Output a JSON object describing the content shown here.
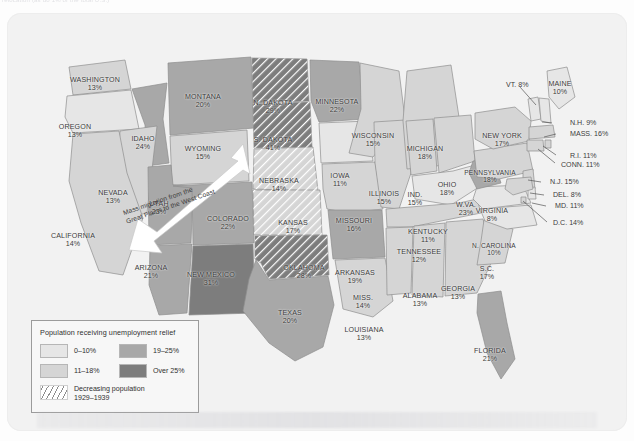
{
  "caption": {
    "top_line": "relocation (as do 1% of the total U.S.)"
  },
  "map": {
    "title": "Population receiving unemployment relief map of the United States",
    "annotation": {
      "migration_line1": "Mass migration from the",
      "migration_line2": "Great Plains to the West Coast"
    },
    "colors": {
      "class_0_10": "#e6e6e6",
      "class_11_18": "#d5d5d5",
      "class_19_25": "#a8a8a8",
      "class_over_25": "#7d7d7d",
      "decreasing_hatch": "#8d8d8d",
      "background": "#f2f2f2",
      "border": "#9b9b9b",
      "label_text": "#3a3a3a"
    },
    "states": [
      {
        "id": "washington",
        "name": "WASHINGTON",
        "pct": "13%",
        "x": 88,
        "y": 72,
        "cls": "class_11_18",
        "hatched": false
      },
      {
        "id": "oregon",
        "name": "OREGON",
        "pct": "13%",
        "x": 68,
        "y": 119,
        "cls": "class_0_10",
        "hatched": false
      },
      {
        "id": "idaho",
        "name": "IDAHO",
        "pct": "24%",
        "x": 136,
        "y": 131,
        "cls": "class_19_25",
        "hatched": false
      },
      {
        "id": "montana",
        "name": "MONTANA",
        "pct": "20%",
        "x": 196,
        "y": 89,
        "cls": "class_19_25",
        "hatched": false
      },
      {
        "id": "wyoming",
        "name": "WYOMING",
        "pct": "15%",
        "x": 196,
        "y": 141,
        "cls": "class_11_18",
        "hatched": false
      },
      {
        "id": "nevada",
        "name": "NEVADA",
        "pct": "13%",
        "x": 106,
        "y": 185,
        "cls": "class_11_18",
        "hatched": false
      },
      {
        "id": "california",
        "name": "CALIFORNIA",
        "pct": "14%",
        "x": 66,
        "y": 228,
        "cls": "class_11_18",
        "hatched": false
      },
      {
        "id": "utah",
        "name": "UTAH",
        "pct": "23%",
        "x": 152,
        "y": 196,
        "cls": "class_19_25",
        "hatched": false
      },
      {
        "id": "arizona",
        "name": "ARIZONA",
        "pct": "21%",
        "x": 144,
        "y": 260,
        "cls": "class_19_25",
        "hatched": false
      },
      {
        "id": "new-mexico",
        "name": "NEW MEXICO",
        "pct": "31%",
        "x": 204,
        "y": 267,
        "cls": "class_over_25",
        "hatched": false
      },
      {
        "id": "colorado",
        "name": "COLORADO",
        "pct": "22%",
        "x": 221,
        "y": 211,
        "cls": "class_19_25",
        "hatched": false
      },
      {
        "id": "north-dakota",
        "name": "N. DAKOTA",
        "pct": "29%",
        "x": 266,
        "y": 95,
        "cls": "class_over_25",
        "hatched": true
      },
      {
        "id": "south-dakota",
        "name": "S. DAKOTA",
        "pct": "41%",
        "x": 266,
        "y": 132,
        "cls": "class_over_25",
        "hatched": true
      },
      {
        "id": "nebraska",
        "name": "NEBRASKA",
        "pct": "14%",
        "x": 272,
        "y": 173,
        "cls": "class_11_18",
        "hatched": true
      },
      {
        "id": "kansas",
        "name": "KANSAS",
        "pct": "17%",
        "x": 286,
        "y": 215,
        "cls": "class_11_18",
        "hatched": true
      },
      {
        "id": "oklahoma",
        "name": "OKLAHOMA",
        "pct": "28%",
        "x": 297,
        "y": 260,
        "cls": "class_over_25",
        "hatched": true
      },
      {
        "id": "texas",
        "name": "TEXAS",
        "pct": "20%",
        "x": 283,
        "y": 305,
        "cls": "class_19_25",
        "hatched": false
      },
      {
        "id": "minnesota",
        "name": "MINNESOTA",
        "pct": "22%",
        "x": 330,
        "y": 94,
        "cls": "class_19_25",
        "hatched": false
      },
      {
        "id": "iowa",
        "name": "IOWA",
        "pct": "11%",
        "x": 333,
        "y": 168,
        "cls": "class_0_10",
        "hatched": false
      },
      {
        "id": "missouri",
        "name": "MISSOURI",
        "pct": "16%",
        "x": 347,
        "y": 213,
        "cls": "class_11_18",
        "hatched": false
      },
      {
        "id": "arkansas",
        "name": "ARKANSAS",
        "pct": "19%",
        "x": 348,
        "y": 265,
        "cls": "class_19_25",
        "hatched": false
      },
      {
        "id": "louisiana",
        "name": "LOUISIANA",
        "pct": "13%",
        "x": 357,
        "y": 322,
        "cls": "class_11_18",
        "hatched": false
      },
      {
        "id": "wisconsin",
        "name": "WISCONSIN",
        "pct": "15%",
        "x": 366,
        "y": 128,
        "cls": "class_11_18",
        "hatched": false
      },
      {
        "id": "illinois",
        "name": "ILLINOIS",
        "pct": "15%",
        "x": 377,
        "y": 186,
        "cls": "class_11_18",
        "hatched": false
      },
      {
        "id": "michigan",
        "name": "MICHIGAN",
        "pct": "18%",
        "x": 418,
        "y": 141,
        "cls": "class_11_18",
        "hatched": false
      },
      {
        "id": "indiana",
        "name": "IND.",
        "pct": "15%",
        "x": 408,
        "y": 187,
        "cls": "class_11_18",
        "hatched": false
      },
      {
        "id": "ohio",
        "name": "OHIO",
        "pct": "18%",
        "x": 440,
        "y": 177,
        "cls": "class_11_18",
        "hatched": false
      },
      {
        "id": "kentucky",
        "name": "KENTUCKY",
        "pct": "11%",
        "x": 421,
        "y": 224,
        "cls": "class_0_10",
        "hatched": false
      },
      {
        "id": "tennessee",
        "name": "TENNESSEE",
        "pct": "12%",
        "x": 412,
        "y": 244,
        "cls": "class_11_18",
        "hatched": false
      },
      {
        "id": "mississippi",
        "name": "MISS.",
        "pct": "14%",
        "x": 356,
        "y": 290,
        "cls": "class_11_18",
        "hatched": false
      },
      {
        "id": "alabama",
        "name": "ALABAMA",
        "pct": "13%",
        "x": 413,
        "y": 288,
        "cls": "class_11_18",
        "hatched": false
      },
      {
        "id": "georgia",
        "name": "GEORGIA",
        "pct": "13%",
        "x": 451,
        "y": 281,
        "cls": "class_11_18",
        "hatched": false
      },
      {
        "id": "florida",
        "name": "FLORIDA",
        "pct": "21%",
        "x": 483,
        "y": 343,
        "cls": "class_19_25",
        "hatched": false
      },
      {
        "id": "south-carolina",
        "name": "S.C.",
        "pct": "17%",
        "x": 480,
        "y": 261,
        "cls": "class_11_18",
        "hatched": false
      },
      {
        "id": "north-carolina",
        "name": "N. CAROLINA",
        "pct": "10%",
        "x": 487,
        "y": 236,
        "cls": "class_0_10",
        "hatched": false
      },
      {
        "id": "virginia",
        "name": "VIRGINIA",
        "pct": "8%",
        "x": 485,
        "y": 203,
        "cls": "class_0_10",
        "hatched": false
      },
      {
        "id": "west-virginia",
        "name": "W.VA.",
        "pct": "23%",
        "x": 459,
        "y": 197,
        "cls": "class_19_25",
        "hatched": false
      },
      {
        "id": "pennsylvania",
        "name": "PENNSYLVANIA",
        "pct": "18%",
        "x": 483,
        "y": 163,
        "cls": "class_11_18",
        "hatched": false
      },
      {
        "id": "new-york",
        "name": "NEW YORK",
        "pct": "17%",
        "x": 495,
        "y": 128,
        "cls": "class_11_18",
        "hatched": false
      }
    ],
    "callouts": [
      {
        "id": "vermont",
        "label": "VT. 8%",
        "tx": 499,
        "ty": 72,
        "lx1": 513,
        "ly1": 74,
        "lx2": 529,
        "ly2": 92
      },
      {
        "id": "maine",
        "label": "MAINE",
        "sub": "10%",
        "tx": 553,
        "ty": 76,
        "two": true
      },
      {
        "id": "new-hampshire",
        "label": "N.H. 9%",
        "tx": 563,
        "ty": 110,
        "lx1": 545,
        "ly1": 110,
        "lx2": 535,
        "ly2": 109
      },
      {
        "id": "massachusetts",
        "label": "MASS. 16%",
        "tx": 563,
        "ty": 121,
        "lx1": 549,
        "ly1": 121,
        "lx2": 537,
        "ly2": 124
      },
      {
        "id": "rhode-island",
        "label": "R.I. 11%",
        "tx": 563,
        "ty": 143,
        "lx1": 549,
        "ly1": 142,
        "lx2": 536,
        "ly2": 133
      },
      {
        "id": "connecticut",
        "label": "CONN. 11%",
        "tx": 554,
        "ty": 152,
        "lx1": 548,
        "ly1": 150,
        "lx2": 531,
        "ly2": 136
      },
      {
        "id": "new-jersey",
        "label": "N.J. 15%",
        "tx": 543,
        "ty": 169,
        "lx1": 534,
        "ly1": 169,
        "lx2": 521,
        "ly2": 167
      },
      {
        "id": "delaware",
        "label": "DEL. 8%",
        "tx": 546,
        "ty": 182,
        "lx1": 537,
        "ly1": 182,
        "lx2": 523,
        "ly2": 180
      },
      {
        "id": "maryland",
        "label": "MD. 11%",
        "tx": 548,
        "ty": 193,
        "lx1": 539,
        "ly1": 193,
        "lx2": 525,
        "ly2": 190
      },
      {
        "id": "dc",
        "label": "D.C. 14%",
        "tx": 546,
        "ty": 210,
        "lx1": 540,
        "ly1": 209,
        "lx2": 516,
        "ly2": 188
      }
    ]
  },
  "legend": {
    "title": "Population receiving unemployment relief",
    "items": [
      {
        "id": "0-10",
        "label": "0–10%",
        "swatch": "sw-a"
      },
      {
        "id": "19-25",
        "label": "19–25%",
        "swatch": "sw-c"
      },
      {
        "id": "11-18",
        "label": "11–18%",
        "swatch": "sw-b"
      },
      {
        "id": "over-25",
        "label": "Over 25%",
        "swatch": "sw-d"
      }
    ],
    "hatch": {
      "line1": "Decreasing population",
      "line2": "1929–1939"
    }
  }
}
